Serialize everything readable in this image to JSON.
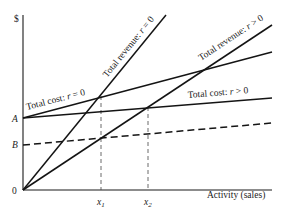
{
  "diagram": {
    "y_axis_label": "$",
    "x_axis_label": "Activity (sales)",
    "origin_label": "0",
    "intercepts": {
      "A": "A",
      "B": "B"
    },
    "x_markers": [
      {
        "symbol": "x",
        "subscript": "1"
      },
      {
        "symbol": "x",
        "subscript": "2"
      }
    ],
    "lines": [
      {
        "id": "total-revenue-r0",
        "label_prefix": "Total revenue:",
        "var": "r",
        "op": "= 0",
        "style": "solid"
      },
      {
        "id": "total-revenue-rpos",
        "label_prefix": "Total revenue:",
        "var": "r",
        "op": "> 0",
        "style": "solid"
      },
      {
        "id": "total-cost-r0",
        "label_prefix": "Total cost:",
        "var": "r",
        "op": "= 0",
        "style": "solid"
      },
      {
        "id": "total-cost-rpos",
        "label_prefix": "Total cost:",
        "var": "r",
        "op": "> 0",
        "style": "solid"
      },
      {
        "id": "fixed-cost-b",
        "label_prefix": "",
        "var": "",
        "op": "",
        "style": "dashed"
      }
    ]
  }
}
